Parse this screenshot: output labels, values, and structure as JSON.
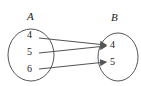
{
  "sets": {
    "A": {
      "label": "A",
      "elements": [
        "4",
        "5",
        "6"
      ]
    },
    "B": {
      "label": "B",
      "elements": [
        "4",
        "5"
      ]
    }
  },
  "mappings": [
    {
      "from": "4",
      "to": "4"
    },
    {
      "from": "5",
      "to": "4"
    },
    {
      "from": "6",
      "to": "5"
    }
  ],
  "colors": {
    "stroke": "#555555",
    "arrow": "#555555"
  }
}
